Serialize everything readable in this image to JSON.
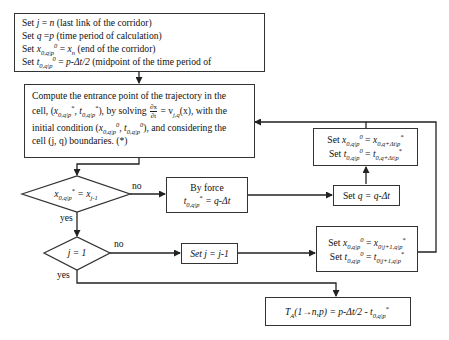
{
  "diagram": {
    "type": "flowchart",
    "nodes": {
      "init": {
        "lines": [
          "Set j = n (last link of the corridor)",
          "Set q = p (time period of calculation)",
          "Set x_{0,q|p}^0 = x_n (end of the corridor)",
          "Set t_{0,q|p}^0 = p-Δt/2 (midpoint of the time period of"
        ],
        "l1_pre": "Set ",
        "l1_var": "j",
        "l1_eq": " = ",
        "l1_val": "n",
        "l1_note": " (last link of the corridor)",
        "l2_pre": "Set ",
        "l2_var": "q",
        "l2_eq": " =",
        "l2_val": "p",
        "l2_note": " (time period of calculation)",
        "l3_pre": "Set ",
        "l3_var": "x",
        "l3_sub": "0,q|p",
        "l3_sup": "0",
        "l3_eq": " = ",
        "l3_val": "x",
        "l3_valsub": "n",
        "l3_note": " (end of the corridor)",
        "l4_pre": "Set ",
        "l4_var": "t",
        "l4_sub": "0,q|p",
        "l4_sup": "0",
        "l4_eq": " = ",
        "l4_val": "p-Δt/2",
        "l4_note": " (midpoint of the time period of"
      },
      "compute": {
        "text": "Compute the entrance point of the trajectory in the cell, (x_{0,q|p}^*, t_{0,q|p}^*), by solving ∂x/∂t = v_{j,q}(x), with the initial condition (x_{0,q|p}^0, t_{0,q|p}^0), and considering the cell (j, q) boundaries. (*)",
        "p1": "Compute the entrance point of the trajectory in the",
        "p2a": "cell, (",
        "p2b": "), by solving",
        "frac_num": "∂x",
        "frac_den": "∂t",
        "p2c": " = v",
        "p2c_sub": "j,q",
        "p2d": "(x), with the",
        "p3a": "initial condition (",
        "p3b": "), and considering the",
        "p4": "cell (j, q) boundaries. (*)",
        "var_x": "x",
        "var_t": "t",
        "sub": "0,q|p",
        "star": "*",
        "zero": "0",
        "comma": ", "
      },
      "decision1": {
        "text": "x_{0,q|p}^* = x_{j-1}",
        "var": "x",
        "sub": "0,q|p",
        "sup": "*",
        "eq": " = x",
        "rhs_sub": "j-1"
      },
      "by_force": {
        "line1": "By force",
        "var": "t",
        "sub": "0,q|p",
        "sup": "*",
        "rhs": " = q-Δt"
      },
      "set_q": {
        "pre": "Set ",
        "var": "q",
        "rhs": " = q-Δt"
      },
      "set_next_q": {
        "line1": "Set x_{0,q|p}^0 = x_{0,q+Δt|p}^*",
        "line2": "Set t_{0,q|p}^0 = t_{0,q+Δt|p}^*",
        "pre": "Set ",
        "vx": "x",
        "vt": "t",
        "sub": "0,q|p",
        "sup0": "0",
        "eq": " = ",
        "rsub": "0,q+Δt|p",
        "star": "*"
      },
      "decision2": {
        "text": "j = 1"
      },
      "set_j": {
        "text": "Set j = j-1"
      },
      "set_next_j": {
        "line1": "Set x_{0,q|p}^0 = x_{0|j+1,q|p}^*",
        "line2": "Set t_{0,q|p}^0 = t_{0|j+1,q|p}^*",
        "pre": "Set ",
        "vx": "x",
        "vt": "t",
        "sub": "0,q|p",
        "sup0": "0",
        "eq": " = ",
        "rsub": "0|j+1,q|p",
        "star": "*"
      },
      "result": {
        "text": "T_A(1→n,p) = p-Δt/2 - t_{0,q|p}^*",
        "T": "T",
        "Tsub": "A",
        "args": "(1→n,p)",
        "rhs": " = p-Δt/2 - t",
        "sub": "0,q|p",
        "sup": "*"
      }
    },
    "edge_labels": {
      "d1_no": "no",
      "d1_yes": "yes",
      "d2_no": "no",
      "d2_yes": "yes"
    },
    "colors": {
      "line": "#222222",
      "box_border": "#333333",
      "background": "#ffffff"
    }
  }
}
